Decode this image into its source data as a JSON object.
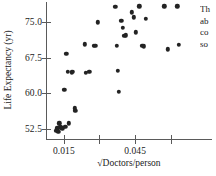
{
  "chart_data": {
    "type": "scatter",
    "title": "",
    "xlabel": "√Doctors/person",
    "ylabel": "Life Expectancy (yr)",
    "xticks": [
      0.015,
      0.03,
      0.045,
      0.06
    ],
    "xtick_labels": [
      "0.015",
      "",
      "0.045",
      ""
    ],
    "yticks": [
      52.5,
      60.0,
      67.5,
      75.0
    ],
    "ytick_labels": [
      "52.5",
      "60.0",
      "67.5",
      "75.0"
    ],
    "xlim": [
      0.0075,
      0.0765
    ],
    "ylim": [
      50.3,
      78.9
    ],
    "grid": false,
    "legend": null,
    "marker": {
      "shape": "circle",
      "color": "#232323",
      "size": 4.4
    },
    "points": [
      {
        "x": 0.0118,
        "y": 52.0
      },
      {
        "x": 0.0122,
        "y": 52.6
      },
      {
        "x": 0.0127,
        "y": 51.8
      },
      {
        "x": 0.0131,
        "y": 53.6
      },
      {
        "x": 0.0136,
        "y": 52.8
      },
      {
        "x": 0.0143,
        "y": 52.6
      },
      {
        "x": 0.0152,
        "y": 60.7
      },
      {
        "x": 0.0156,
        "y": 52.9
      },
      {
        "x": 0.0161,
        "y": 68.3
      },
      {
        "x": 0.0168,
        "y": 64.5
      },
      {
        "x": 0.0172,
        "y": 53.6
      },
      {
        "x": 0.0183,
        "y": 64.4
      },
      {
        "x": 0.0188,
        "y": 64.5
      },
      {
        "x": 0.0197,
        "y": 56.8
      },
      {
        "x": 0.0199,
        "y": 56.3
      },
      {
        "x": 0.0238,
        "y": 70.4
      },
      {
        "x": 0.0243,
        "y": 64.3
      },
      {
        "x": 0.0258,
        "y": 64.5
      },
      {
        "x": 0.0276,
        "y": 70.0
      },
      {
        "x": 0.0283,
        "y": 70.1
      },
      {
        "x": 0.0294,
        "y": 75.0
      },
      {
        "x": 0.0367,
        "y": 78.3
      },
      {
        "x": 0.0372,
        "y": 70.1
      },
      {
        "x": 0.0376,
        "y": 64.7
      },
      {
        "x": 0.0381,
        "y": 60.3
      },
      {
        "x": 0.0392,
        "y": 75.4
      },
      {
        "x": 0.0398,
        "y": 73.9
      },
      {
        "x": 0.0404,
        "y": 72.2
      },
      {
        "x": 0.0411,
        "y": 72.3
      },
      {
        "x": 0.0437,
        "y": 77.1
      },
      {
        "x": 0.0444,
        "y": 76.1
      },
      {
        "x": 0.0452,
        "y": 72.9
      },
      {
        "x": 0.0468,
        "y": 78.4
      },
      {
        "x": 0.0481,
        "y": 70.0
      },
      {
        "x": 0.0487,
        "y": 69.9
      },
      {
        "x": 0.0494,
        "y": 75.8
      },
      {
        "x": 0.0573,
        "y": 78.4
      },
      {
        "x": 0.0588,
        "y": 69.3
      },
      {
        "x": 0.0628,
        "y": 78.4
      },
      {
        "x": 0.0634,
        "y": 70.3
      }
    ]
  },
  "side_text": {
    "lines": [
      "Th",
      "ab",
      "co",
      "so"
    ]
  }
}
